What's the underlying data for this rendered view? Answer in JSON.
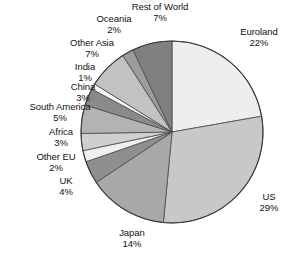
{
  "chart_data": {
    "type": "pie",
    "title": "",
    "subtitle": "",
    "xlabel": "",
    "ylabel": "",
    "legend_position": "none",
    "grid": false,
    "units": "percent",
    "start_angle_deg": 0,
    "direction": "clockwise",
    "total_labeled_percent": 99,
    "categories": [
      "Euroland",
      "US",
      "Japan",
      "UK",
      "Other EU",
      "Africa",
      "South America",
      "China",
      "India",
      "Other Asia",
      "Oceania",
      "Rest of World"
    ],
    "values": [
      22,
      29,
      14,
      4,
      2,
      3,
      5,
      3,
      1,
      7,
      2,
      7
    ],
    "colors": [
      "#eeeeee",
      "#c8c8c8",
      "#a8a8a8",
      "#8f8f8f",
      "#f0f0f0",
      "#cfcfcf",
      "#b3b3b3",
      "#8a8a8a",
      "#f4f4f4",
      "#c2c2c2",
      "#9c9c9c",
      "#808080"
    ],
    "slices": [
      {
        "label": "Euroland",
        "value": 22,
        "value_text": "22%",
        "color": "#eeeeee"
      },
      {
        "label": "US",
        "value": 29,
        "value_text": "29%",
        "color": "#c8c8c8"
      },
      {
        "label": "Japan",
        "value": 14,
        "value_text": "14%",
        "color": "#a8a8a8"
      },
      {
        "label": "UK",
        "value": 4,
        "value_text": "4%",
        "color": "#8f8f8f"
      },
      {
        "label": "Other EU",
        "value": 2,
        "value_text": "2%",
        "color": "#f0f0f0"
      },
      {
        "label": "Africa",
        "value": 3,
        "value_text": "3%",
        "color": "#cfcfcf"
      },
      {
        "label": "South America",
        "value": 5,
        "value_text": "5%",
        "color": "#b3b3b3"
      },
      {
        "label": "China",
        "value": 3,
        "value_text": "3%",
        "color": "#8a8a8a"
      },
      {
        "label": "India",
        "value": 1,
        "value_text": "1%",
        "color": "#f4f4f4"
      },
      {
        "label": "Other Asia",
        "value": 7,
        "value_text": "7%",
        "color": "#c2c2c2"
      },
      {
        "label": "Oceania",
        "value": 2,
        "value_text": "2%",
        "color": "#9c9c9c"
      },
      {
        "label": "Rest of World",
        "value": 7,
        "value_text": "7%",
        "color": "#808080"
      }
    ]
  },
  "labels": {
    "euroland": {
      "name": "Euroland",
      "pct": "22%"
    },
    "us": {
      "name": "US",
      "pct": "29%"
    },
    "japan": {
      "name": "Japan",
      "pct": "14%"
    },
    "uk": {
      "name": "UK",
      "pct": "4%"
    },
    "other_eu": {
      "name": "Other EU",
      "pct": "2%"
    },
    "africa": {
      "name": "Africa",
      "pct": "3%"
    },
    "south_america": {
      "name": "South America",
      "pct": "5%"
    },
    "china": {
      "name": "China",
      "pct": "3%"
    },
    "india": {
      "name": "India",
      "pct": "1%"
    },
    "other_asia": {
      "name": "Other Asia",
      "pct": "7%"
    },
    "oceania": {
      "name": "Oceania",
      "pct": "2%"
    },
    "rest_of_world": {
      "name": "Rest of World",
      "pct": "7%"
    }
  },
  "geometry": {
    "center_x": 172,
    "center_y": 132,
    "radius": 91
  },
  "style": {
    "background": "#ffffff",
    "outline_color": "#3d3d3d",
    "divider_color": "#4a4a4a",
    "text_color": "#111111"
  }
}
